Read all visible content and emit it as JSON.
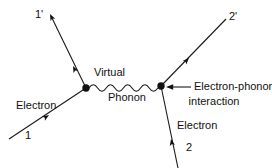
{
  "diagram": {
    "stroke_color": "#1a1a1a",
    "background_color": "#ffffff",
    "labels": {
      "in_electron_1": "1",
      "out_electron_1_prime": "1'",
      "in_electron_2": "2",
      "out_electron_2_prime": "2'",
      "electron_left": "Electron",
      "electron_right": "Electron",
      "virtual": "Virtual",
      "phonon": "Phonon",
      "interaction_line1": "Electron-phonon",
      "interaction_line2": "interaction"
    },
    "vertices": [
      {
        "name": "left-vertex",
        "x": 86,
        "y": 88
      },
      {
        "name": "right-vertex",
        "x": 161,
        "y": 86
      }
    ],
    "lines": [
      {
        "name": "electron-1-incoming",
        "x1": 9,
        "y1": 139,
        "x2": 86,
        "y2": 88
      },
      {
        "name": "electron-1-prime-outgoing",
        "x1": 86,
        "y1": 88,
        "x2": 50,
        "y2": 14
      },
      {
        "name": "electron-2-incoming",
        "x1": 178,
        "y1": 168,
        "x2": 161,
        "y2": 86
      },
      {
        "name": "electron-2-prime-outgoing",
        "x1": 161,
        "y1": 86,
        "x2": 226,
        "y2": 19
      },
      {
        "name": "virtual-phonon-wave",
        "x1": 89,
        "y1": 88,
        "x2": 158,
        "y2": 87
      }
    ],
    "arrows": [
      {
        "name": "arrow-electron-1",
        "x": 47,
        "y": 117,
        "direction": "up-right"
      },
      {
        "name": "arrow-electron-1-prime",
        "x": 74,
        "y": 68,
        "direction": "up-left"
      },
      {
        "name": "arrow-electron-2",
        "x": 172,
        "y": 141,
        "direction": "up"
      },
      {
        "name": "arrow-electron-2-prime",
        "x": 188,
        "y": 59,
        "direction": "up-right"
      },
      {
        "name": "arrow-tip-1-prime",
        "x": 50,
        "y": 14,
        "direction": "up-left"
      },
      {
        "name": "arrow-interaction-pointer",
        "x": 167,
        "y": 87,
        "direction": "left"
      }
    ],
    "annotation_leader": {
      "name": "interaction-leader-line",
      "x1": 172,
      "y1": 87,
      "x2": 191,
      "y2": 87
    }
  }
}
